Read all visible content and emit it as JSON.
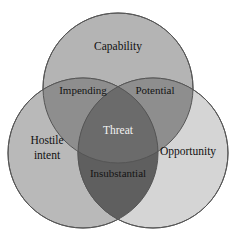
{
  "diagram": {
    "type": "venn-3-circle",
    "background_color": "#ffffff",
    "stroke_color": "#555555",
    "circles": [
      {
        "id": "capability",
        "label": "Capability",
        "position": "top",
        "fill_color": "#b4b4b4",
        "cx": 118,
        "cy": 88,
        "r": 75,
        "label_x": 118,
        "label_y": 47
      },
      {
        "id": "hostile-intent",
        "label_line1": "Hostile",
        "label_line2": "intent",
        "label": "Hostile intent",
        "position": "bottom-left",
        "fill_color": "#b9b9b9",
        "cx": 83,
        "cy": 153,
        "r": 75,
        "label_x": 47,
        "label_y": 148
      },
      {
        "id": "opportunity",
        "label": "Opportunity",
        "position": "bottom-right",
        "fill_color": "#d5d5d5",
        "cx": 153,
        "cy": 153,
        "r": 75,
        "label_x": 188,
        "label_y": 152
      }
    ],
    "intersections": [
      {
        "id": "impending",
        "label": "Impending",
        "between": [
          "capability",
          "hostile-intent"
        ],
        "fill_color": "#8e8e8e",
        "label_x": 83,
        "label_y": 91
      },
      {
        "id": "potential",
        "label": "Potential",
        "between": [
          "capability",
          "opportunity"
        ],
        "fill_color": "#8e8e8e",
        "label_x": 155,
        "label_y": 91
      },
      {
        "id": "insubstantial",
        "label": "Insubstantial",
        "between": [
          "hostile-intent",
          "opportunity"
        ],
        "fill_color": "#5f5f5f",
        "label_x": 118,
        "label_y": 174
      }
    ],
    "center": {
      "id": "threat",
      "label": "Threat",
      "between": [
        "capability",
        "hostile-intent",
        "opportunity"
      ],
      "fill_color": "#6b6b6b",
      "label_color": "#f2f2f2",
      "label_x": 118,
      "label_y": 131
    }
  }
}
